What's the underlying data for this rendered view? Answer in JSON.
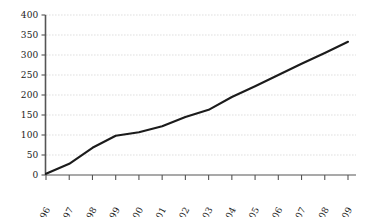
{
  "chart_data": {
    "type": "line",
    "title": "",
    "subtitle": "",
    "xlabel": "",
    "ylabel": "",
    "categories": [
      "1996",
      "1997",
      "1998",
      "1999",
      "2000",
      "2001",
      "2002",
      "2003",
      "2004",
      "2005",
      "2006",
      "2007",
      "2008",
      "2009"
    ],
    "values": [
      3,
      28,
      68,
      98,
      107,
      122,
      145,
      163,
      195,
      222,
      250,
      278,
      305,
      333
    ],
    "series": [
      {
        "name": "series-1",
        "values": [
          3,
          28,
          68,
          98,
          107,
          122,
          145,
          163,
          195,
          222,
          250,
          278,
          305,
          333
        ]
      }
    ],
    "ylim": [
      0,
      400
    ],
    "y_ticks": [
      0,
      50,
      100,
      150,
      200,
      250,
      300,
      350,
      400
    ],
    "y_tick_labels": [
      "0",
      "50",
      "100",
      "150",
      "200",
      "250",
      "300",
      "350",
      "400"
    ],
    "x_tick_labels": [
      "1996",
      "1997",
      "1998",
      "1999",
      "2000",
      "2001",
      "2002",
      "2003",
      "2004",
      "2005",
      "2006",
      "2007",
      "2008",
      "2009"
    ],
    "grid": "horizontal-dotted",
    "legend": "none",
    "legend_position": "none",
    "annotations": [],
    "line_color": "#1b1b1b",
    "grid_color": "#b9b9b9",
    "axis_color": "#555555",
    "background_color": "#ffffff",
    "x_label_rotation_deg": -62
  },
  "axes": {
    "y_axis_name": "value-axis",
    "x_axis_name": "year-axis"
  }
}
